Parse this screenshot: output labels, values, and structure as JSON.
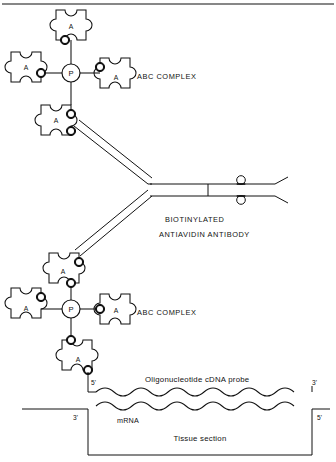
{
  "figure": {
    "title_rule": "top-divider",
    "background": "#ffffff",
    "ink": "#111111"
  },
  "labels": {
    "abc_complex_upper": "ABC COMPLEX",
    "abc_complex_lower": "ABC COMPLEX",
    "antibody_line1": "BIOTINYLATED",
    "antibody_line2": "ANTIAVIDIN ANTIBODY",
    "probe": "Oligonucleotide cDNA probe",
    "mrna": "mRNA",
    "tissue": "Tissue section"
  },
  "primes": {
    "probe_five": "5'",
    "probe_three": "3'",
    "mrna_three": "3'",
    "mrna_five": "5'"
  },
  "glyphs": {
    "avidin": "A",
    "peroxidase": "P"
  },
  "complex_upper": {
    "center": {
      "x": 71,
      "y": 73
    },
    "peroxidase_label": "P",
    "avidin_subunits": [
      {
        "position": "top",
        "label": "A"
      },
      {
        "position": "left",
        "label": "A"
      },
      {
        "position": "right",
        "label": "A"
      },
      {
        "position": "bottom",
        "label": "A"
      }
    ]
  },
  "complex_lower": {
    "center": {
      "x": 71,
      "y": 309
    },
    "peroxidase_label": "P",
    "avidin_subunits": [
      {
        "position": "top",
        "label": "A"
      },
      {
        "position": "left",
        "label": "A"
      },
      {
        "position": "right",
        "label": "A"
      },
      {
        "position": "bottom",
        "label": "A"
      }
    ]
  },
  "antibody": {
    "shape": "sideways-Y",
    "biotin_count": 2,
    "biotin_marker": "open-circle",
    "fab_arms": 2
  },
  "hybridization": {
    "probe_strand": "wavy-line-upper",
    "mrna_strand": "wavy-line-lower",
    "wave_count": 9
  }
}
